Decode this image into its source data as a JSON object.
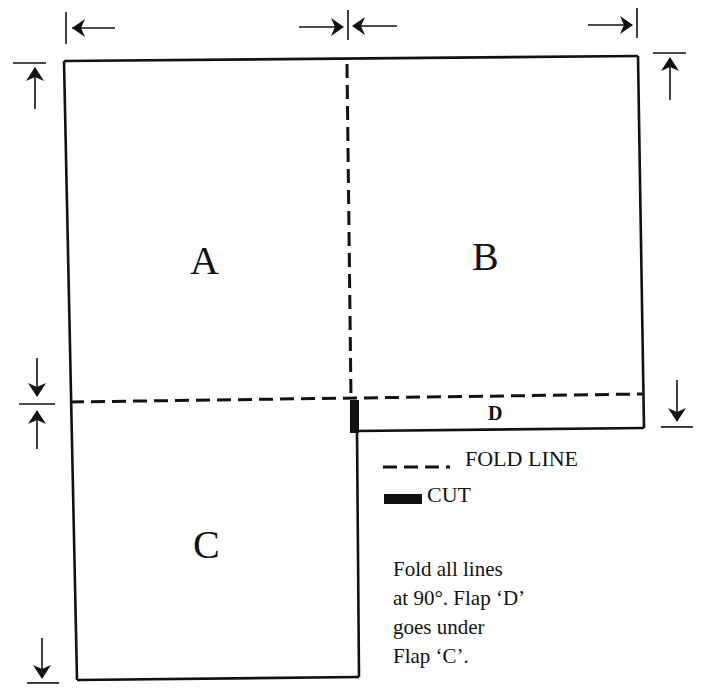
{
  "diagram": {
    "panels": [
      {
        "id": "A",
        "label": "A"
      },
      {
        "id": "B",
        "label": "B"
      },
      {
        "id": "C",
        "label": "C"
      },
      {
        "id": "D",
        "label": "D"
      }
    ],
    "legend": {
      "fold_line_label": "FOLD LINE",
      "cut_label": "CUT"
    },
    "note": {
      "lines": [
        "Fold all lines",
        "at 90°. Flap ‘D’",
        "goes under",
        "Flap ‘C’."
      ]
    },
    "colors": {
      "ink": "#111111",
      "paper": "#ffffff"
    }
  }
}
